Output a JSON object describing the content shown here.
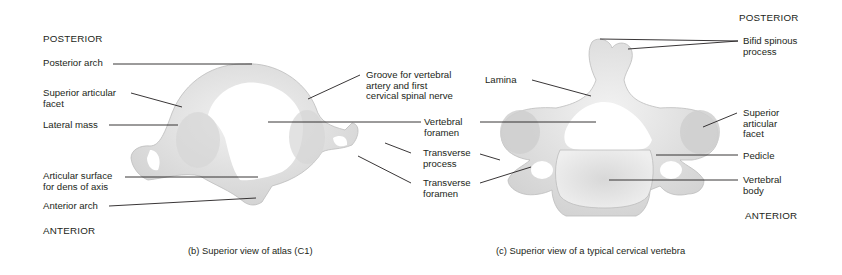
{
  "figure_b": {
    "orientation_top": "POSTERIOR",
    "orientation_bottom": "ANTERIOR",
    "caption": "(b) Superior view of atlas (C1)",
    "labels": {
      "posterior_arch": "Posterior arch",
      "superior_articular_facet": "Superior articular\nfacet",
      "lateral_mass": "Lateral mass",
      "articular_surface": "Articular surface\nfor dens of axis",
      "anterior_arch": "Anterior arch",
      "groove": "Groove for vertebral\nartery and first\ncervical spinal nerve"
    }
  },
  "shared_labels": {
    "vertebral_foramen": "Vertebral\nforamen",
    "transverse_process": "Transverse\nprocess",
    "transverse_foramen": "Transverse\nforamen"
  },
  "figure_c": {
    "orientation_top": "POSTERIOR",
    "orientation_bottom": "ANTERIOR",
    "caption": "(c) Superior view of a typical cervical vertebra",
    "labels": {
      "bifid_spinous_process": "Bifid spinous\nprocess",
      "lamina": "Lamina",
      "superior_articular_facet": "Superior\narticular\nfacet",
      "pedicle": "Pedicle",
      "vertebral_body": "Vertebral\nbody"
    }
  },
  "colors": {
    "bone": "#e6e6e6",
    "bone_shade": "#c9c9c9",
    "leader_line": "#231f20",
    "text": "#231f20"
  }
}
